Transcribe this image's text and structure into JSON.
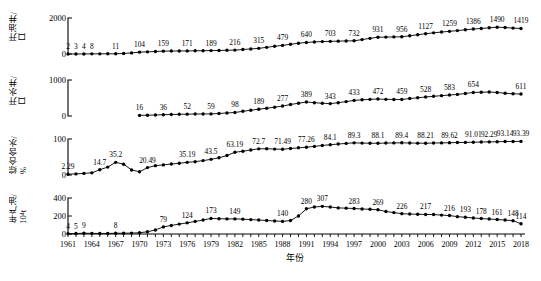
{
  "figure": {
    "xaxis_title": "年份",
    "x_start": 1961,
    "x_end": 2018,
    "x_tick_step": 3,
    "x_ticks": [
      "1961",
      "1964",
      "1967",
      "1970",
      "1973",
      "1976",
      "1979",
      "1982",
      "1985",
      "1988",
      "1991",
      "1994",
      "1997",
      "2000",
      "2003",
      "2006",
      "2009",
      "2012",
      "2015",
      "2018"
    ],
    "marker": "filled-circle",
    "line_color": "#000000",
    "background": "#ffffff"
  },
  "chart_data": [
    {
      "type": "line",
      "panel": 1,
      "title": "",
      "ylabel": "开油井/口",
      "ylabel_lines": [
        "开油井/",
        "口"
      ],
      "xlabel": "",
      "ylim": [
        0,
        2000
      ],
      "yticks": [
        0,
        2000
      ],
      "ytick_labels": [
        "0",
        "2000"
      ],
      "grid": false,
      "x": [
        1961,
        1962,
        1963,
        1964,
        1965,
        1966,
        1967,
        1968,
        1969,
        1970,
        1971,
        1972,
        1973,
        1974,
        1975,
        1976,
        1977,
        1978,
        1979,
        1980,
        1981,
        1982,
        1983,
        1984,
        1985,
        1986,
        1987,
        1988,
        1989,
        1990,
        1991,
        1992,
        1993,
        1994,
        1995,
        1996,
        1997,
        1998,
        1999,
        2000,
        2001,
        2002,
        2003,
        2004,
        2005,
        2006,
        2007,
        2008,
        2009,
        2010,
        2011,
        2012,
        2013,
        2014,
        2015,
        2016,
        2017,
        2018
      ],
      "values": [
        2,
        3,
        4,
        8,
        9,
        10,
        11,
        30,
        60,
        104,
        120,
        140,
        159,
        163,
        167,
        171,
        178,
        184,
        189,
        198,
        207,
        216,
        250,
        280,
        315,
        370,
        430,
        479,
        540,
        600,
        640,
        670,
        690,
        703,
        715,
        725,
        732,
        800,
        870,
        931,
        940,
        950,
        956,
        1010,
        1070,
        1127,
        1175,
        1220,
        1259,
        1300,
        1345,
        1386,
        1420,
        1455,
        1490,
        1470,
        1440,
        1419
      ],
      "labeled_points": [
        {
          "x": 1961,
          "label": "2"
        },
        {
          "x": 1962,
          "label": "3"
        },
        {
          "x": 1963,
          "label": "4"
        },
        {
          "x": 1964,
          "label": "8"
        },
        {
          "x": 1967,
          "label": "11"
        },
        {
          "x": 1970,
          "label": "104"
        },
        {
          "x": 1973,
          "label": "159"
        },
        {
          "x": 1976,
          "label": "171"
        },
        {
          "x": 1979,
          "label": "189"
        },
        {
          "x": 1982,
          "label": "216"
        },
        {
          "x": 1985,
          "label": "315"
        },
        {
          "x": 1988,
          "label": "479"
        },
        {
          "x": 1991,
          "label": "640"
        },
        {
          "x": 1994,
          "label": "703"
        },
        {
          "x": 1997,
          "label": "732"
        },
        {
          "x": 2000,
          "label": "931"
        },
        {
          "x": 2003,
          "label": "956"
        },
        {
          "x": 2006,
          "label": "1127"
        },
        {
          "x": 2009,
          "label": "1259"
        },
        {
          "x": 2012,
          "label": "1386"
        },
        {
          "x": 2015,
          "label": "1490"
        },
        {
          "x": 2018,
          "label": "1419"
        }
      ]
    },
    {
      "type": "line",
      "panel": 2,
      "title": "",
      "ylabel": "开水井/口",
      "ylabel_lines": [
        "开水井/",
        "口"
      ],
      "xlabel": "",
      "ylim": [
        0,
        1000
      ],
      "yticks": [
        0,
        1000
      ],
      "ytick_labels": [
        "0",
        "1000"
      ],
      "grid": false,
      "x": [
        1970,
        1971,
        1972,
        1973,
        1974,
        1975,
        1976,
        1977,
        1978,
        1979,
        1980,
        1981,
        1982,
        1983,
        1984,
        1985,
        1986,
        1987,
        1988,
        1989,
        1990,
        1991,
        1992,
        1993,
        1994,
        1995,
        1996,
        1997,
        1998,
        1999,
        2000,
        2001,
        2002,
        2003,
        2004,
        2005,
        2006,
        2007,
        2008,
        2009,
        2010,
        2011,
        2012,
        2013,
        2014,
        2015,
        2016,
        2017,
        2018
      ],
      "values": [
        16,
        22,
        28,
        36,
        42,
        47,
        52,
        54,
        57,
        59,
        70,
        84,
        98,
        130,
        160,
        189,
        215,
        245,
        277,
        320,
        355,
        389,
        370,
        355,
        343,
        370,
        400,
        433,
        450,
        462,
        472,
        462,
        460,
        459,
        485,
        505,
        528,
        548,
        565,
        583,
        600,
        625,
        654,
        660,
        665,
        654,
        630,
        618,
        611
      ],
      "labeled_points": [
        {
          "x": 1970,
          "label": "16"
        },
        {
          "x": 1973,
          "label": "36"
        },
        {
          "x": 1976,
          "label": "52"
        },
        {
          "x": 1979,
          "label": "59"
        },
        {
          "x": 1982,
          "label": "98"
        },
        {
          "x": 1985,
          "label": "189"
        },
        {
          "x": 1988,
          "label": "277"
        },
        {
          "x": 1991,
          "label": "389"
        },
        {
          "x": 1994,
          "label": "343"
        },
        {
          "x": 1997,
          "label": "433"
        },
        {
          "x": 2000,
          "label": "472"
        },
        {
          "x": 2003,
          "label": "459"
        },
        {
          "x": 2006,
          "label": "528"
        },
        {
          "x": 2009,
          "label": "583"
        },
        {
          "x": 2012,
          "label": "654"
        },
        {
          "x": 2018,
          "label": "611"
        }
      ]
    },
    {
      "type": "line",
      "panel": 3,
      "title": "",
      "ylabel": "综合含水/%",
      "ylabel_lines": [
        "综合含水/",
        "%"
      ],
      "xlabel": "",
      "ylim": [
        0,
        100
      ],
      "yticks": [
        0,
        100
      ],
      "ytick_labels": [
        "0",
        "100"
      ],
      "grid": false,
      "x": [
        1961,
        1962,
        1963,
        1964,
        1965,
        1966,
        1967,
        1968,
        1969,
        1970,
        1971,
        1972,
        1973,
        1974,
        1975,
        1976,
        1977,
        1978,
        1979,
        1980,
        1981,
        1982,
        1983,
        1984,
        1985,
        1986,
        1987,
        1988,
        1989,
        1990,
        1991,
        1992,
        1993,
        1994,
        1995,
        1996,
        1997,
        1998,
        1999,
        2000,
        2001,
        2002,
        2003,
        2004,
        2005,
        2006,
        2007,
        2008,
        2009,
        2010,
        2011,
        2012,
        2013,
        2014,
        2015,
        2016,
        2017,
        2018
      ],
      "values": [
        2.29,
        3.0,
        4.5,
        6.0,
        14.7,
        22.0,
        35.2,
        30.0,
        14.0,
        9.0,
        20.49,
        26.0,
        28.0,
        30.5,
        32.5,
        35.19,
        37.0,
        40.0,
        43.5,
        48.0,
        54.0,
        63.19,
        66.0,
        69.5,
        72.7,
        73.0,
        72.0,
        71.49,
        73.5,
        75.5,
        77.26,
        79.5,
        82.0,
        84.1,
        86.0,
        87.8,
        89.3,
        88.6,
        88.3,
        88.1,
        88.7,
        89.1,
        89.4,
        88.9,
        88.5,
        88.21,
        88.8,
        89.2,
        89.62,
        90.2,
        90.6,
        91.01,
        91.7,
        92.0,
        92.29,
        93.14,
        93.2,
        93.39
      ],
      "labeled_points": [
        {
          "x": 1961,
          "label": "2.29"
        },
        {
          "x": 1965,
          "label": "14.7"
        },
        {
          "x": 1967,
          "label": "35.2"
        },
        {
          "x": 1971,
          "label": "20.49"
        },
        {
          "x": 1976,
          "label": "35.19"
        },
        {
          "x": 1979,
          "label": "43.5"
        },
        {
          "x": 1982,
          "label": "63.19"
        },
        {
          "x": 1985,
          "label": "72.7"
        },
        {
          "x": 1988,
          "label": "71.49"
        },
        {
          "x": 1991,
          "label": "77.26"
        },
        {
          "x": 1994,
          "label": "84.1"
        },
        {
          "x": 1997,
          "label": "89.3"
        },
        {
          "x": 2000,
          "label": "88.1"
        },
        {
          "x": 2003,
          "label": "89.4"
        },
        {
          "x": 2006,
          "label": "88.21"
        },
        {
          "x": 2009,
          "label": "89.62"
        },
        {
          "x": 2012,
          "label": "91.01"
        },
        {
          "x": 2014,
          "label": "92.29"
        },
        {
          "x": 2016,
          "label": "93.14"
        },
        {
          "x": 2018,
          "label": "93.39"
        }
      ]
    },
    {
      "type": "line",
      "panel": 4,
      "title": "",
      "ylabel": "年产油/10⁴t",
      "ylabel_lines": [
        "年产油/",
        "10⁴t"
      ],
      "xlabel": "年份",
      "ylim": [
        0,
        400
      ],
      "yticks": [
        0,
        200,
        400
      ],
      "ytick_labels": [
        "0",
        "200",
        "400"
      ],
      "grid": false,
      "x": [
        1961,
        1962,
        1963,
        1964,
        1965,
        1966,
        1967,
        1968,
        1969,
        1970,
        1971,
        1972,
        1973,
        1974,
        1975,
        1976,
        1977,
        1978,
        1979,
        1980,
        1981,
        1982,
        1983,
        1984,
        1985,
        1986,
        1987,
        1988,
        1989,
        1990,
        1991,
        1992,
        1993,
        1994,
        1995,
        1996,
        1997,
        1998,
        1999,
        2000,
        2001,
        2002,
        2003,
        2004,
        2005,
        2006,
        2007,
        2008,
        2009,
        2010,
        2011,
        2012,
        2013,
        2014,
        2015,
        2016,
        2017,
        2018
      ],
      "values": [
        4,
        5,
        9,
        7,
        6,
        6,
        8,
        9,
        10,
        14,
        25,
        45,
        79,
        95,
        110,
        124,
        140,
        155,
        173,
        170,
        168,
        168,
        165,
        160,
        155,
        150,
        145,
        140,
        150,
        200,
        280,
        300,
        307,
        300,
        290,
        287,
        283,
        278,
        275,
        269,
        250,
        238,
        226,
        222,
        219,
        217,
        216,
        210,
        205,
        193,
        186,
        178,
        172,
        166,
        161,
        155,
        148,
        114
      ],
      "labeled_points": [
        {
          "x": 1961,
          "label": "4"
        },
        {
          "x": 1962,
          "label": "5"
        },
        {
          "x": 1963,
          "label": "9"
        },
        {
          "x": 1967,
          "label": "8"
        },
        {
          "x": 1973,
          "label": "79"
        },
        {
          "x": 1976,
          "label": "124"
        },
        {
          "x": 1979,
          "label": "173"
        },
        {
          "x": 1982,
          "label": "149"
        },
        {
          "x": 1988,
          "label": "140"
        },
        {
          "x": 1991,
          "label": "280"
        },
        {
          "x": 1993,
          "label": "307"
        },
        {
          "x": 1997,
          "label": "283"
        },
        {
          "x": 2000,
          "label": "269"
        },
        {
          "x": 2003,
          "label": "226"
        },
        {
          "x": 2006,
          "label": "217"
        },
        {
          "x": 2009,
          "label": "216"
        },
        {
          "x": 2011,
          "label": "193"
        },
        {
          "x": 2013,
          "label": "178"
        },
        {
          "x": 2015,
          "label": "161"
        },
        {
          "x": 2017,
          "label": "148"
        },
        {
          "x": 2018,
          "label": "114"
        }
      ]
    }
  ]
}
